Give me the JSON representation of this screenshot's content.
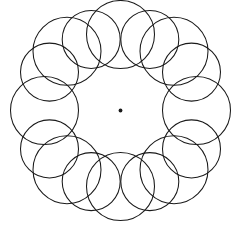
{
  "figure": {
    "canvas": {
      "width": 237,
      "height": 232,
      "background": "#ffffff"
    },
    "stroke": {
      "color": "#1a1a1a",
      "width": 1.05,
      "fill": "none"
    },
    "center_marker": {
      "name": "center-dot",
      "cx": 120.5,
      "cy": 110.5,
      "r": 1.9,
      "color": "#1a1a1a"
    },
    "bounding_box": {
      "x_min": 8,
      "y_min": 13,
      "x_max": 228,
      "y_max": 216
    },
    "construction": {
      "center_x": 120.5,
      "center_y": 110.5,
      "ring_radius_outer": 76,
      "ring_radius_inner": 66,
      "circle_radius_large": 34,
      "circle_radius_small": 29,
      "count": 16
    },
    "circles": [
      {
        "cx": 120.5,
        "cy": 34.5,
        "r": 34
      },
      {
        "cx": 149.8,
        "cy": 39.4,
        "r": 29
      },
      {
        "cx": 174.0,
        "cy": 51.3,
        "r": 34
      },
      {
        "cx": 191.5,
        "cy": 72.1,
        "r": 29
      },
      {
        "cx": 196.5,
        "cy": 110.5,
        "r": 34
      },
      {
        "cx": 191.5,
        "cy": 148.9,
        "r": 29
      },
      {
        "cx": 174.0,
        "cy": 169.7,
        "r": 34
      },
      {
        "cx": 149.8,
        "cy": 181.6,
        "r": 29
      },
      {
        "cx": 120.5,
        "cy": 186.5,
        "r": 34
      },
      {
        "cx": 91.2,
        "cy": 181.6,
        "r": 29
      },
      {
        "cx": 67.0,
        "cy": 169.7,
        "r": 34
      },
      {
        "cx": 49.5,
        "cy": 148.9,
        "r": 29
      },
      {
        "cx": 44.5,
        "cy": 110.5,
        "r": 34
      },
      {
        "cx": 49.5,
        "cy": 72.1,
        "r": 29
      },
      {
        "cx": 67.0,
        "cy": 51.3,
        "r": 34
      },
      {
        "cx": 91.2,
        "cy": 39.4,
        "r": 29
      }
    ]
  }
}
